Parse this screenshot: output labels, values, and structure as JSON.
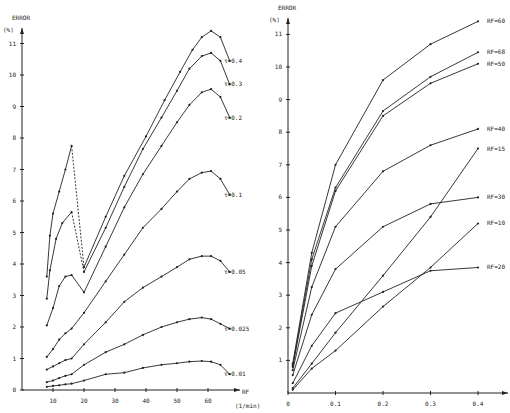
{
  "chart_data": [
    {
      "type": "line",
      "title": "",
      "ylabel": "ERROR",
      "yunit": "(%)",
      "xlabel": "RF",
      "xunit": "(1/min)",
      "xlim": [
        0,
        70
      ],
      "ylim": [
        0,
        11.5
      ],
      "xticks": [
        10,
        20,
        30,
        40,
        50,
        60
      ],
      "yticks": [
        0,
        1,
        2,
        3,
        4,
        5,
        6,
        7,
        8,
        9,
        10,
        11
      ],
      "grid": false,
      "legend_position": "inline-right",
      "note": "Segments between RF=16 and RF=20 for tau=0.4 and tau=0.3 are dashed",
      "series": [
        {
          "name": "τ=0.4",
          "dashed_segment": [
            16,
            20
          ],
          "points": [
            [
              8,
              3.6
            ],
            [
              9,
              4.9
            ],
            [
              10,
              5.6
            ],
            [
              12,
              6.3
            ],
            [
              14,
              7.0
            ],
            [
              16,
              7.75
            ],
            [
              20,
              3.9
            ],
            [
              27,
              5.5
            ],
            [
              33,
              6.8
            ],
            [
              40,
              8.05
            ],
            [
              46,
              9.2
            ],
            [
              51,
              10.1
            ],
            [
              55,
              10.8
            ],
            [
              58,
              11.2
            ],
            [
              61,
              11.4
            ],
            [
              64,
              11.2
            ],
            [
              67,
              10.45
            ]
          ]
        },
        {
          "name": "τ=0.3",
          "dashed_segment": [
            16,
            20
          ],
          "points": [
            [
              8,
              2.9
            ],
            [
              9,
              3.8
            ],
            [
              11,
              4.8
            ],
            [
              13,
              5.3
            ],
            [
              16,
              5.65
            ],
            [
              20,
              3.75
            ],
            [
              27,
              5.15
            ],
            [
              33,
              6.45
            ],
            [
              39,
              7.65
            ],
            [
              45,
              8.65
            ],
            [
              50,
              9.5
            ],
            [
              54,
              10.2
            ],
            [
              58,
              10.6
            ],
            [
              61,
              10.7
            ],
            [
              64,
              10.45
            ],
            [
              67,
              9.7
            ]
          ]
        },
        {
          "name": "τ=0.2",
          "points": [
            [
              8,
              2.05
            ],
            [
              10,
              2.6
            ],
            [
              12,
              3.3
            ],
            [
              14,
              3.6
            ],
            [
              16,
              3.65
            ],
            [
              20,
              3.1
            ],
            [
              27,
              4.55
            ],
            [
              33,
              5.8
            ],
            [
              39,
              6.85
            ],
            [
              45,
              7.75
            ],
            [
              50,
              8.5
            ],
            [
              54,
              9.05
            ],
            [
              58,
              9.45
            ],
            [
              61,
              9.55
            ],
            [
              64,
              9.3
            ],
            [
              67,
              8.65
            ]
          ]
        },
        {
          "name": "τ=0.1",
          "points": [
            [
              8,
              1.05
            ],
            [
              10,
              1.3
            ],
            [
              12,
              1.6
            ],
            [
              14,
              1.8
            ],
            [
              16,
              1.95
            ],
            [
              20,
              2.45
            ],
            [
              27,
              3.45
            ],
            [
              33,
              4.3
            ],
            [
              39,
              5.15
            ],
            [
              45,
              5.75
            ],
            [
              50,
              6.3
            ],
            [
              54,
              6.7
            ],
            [
              58,
              6.9
            ],
            [
              61,
              6.95
            ],
            [
              64,
              6.7
            ],
            [
              67,
              6.2
            ]
          ]
        },
        {
          "name": "τ=0.05",
          "points": [
            [
              8,
              0.65
            ],
            [
              10,
              0.75
            ],
            [
              12,
              0.85
            ],
            [
              14,
              0.95
            ],
            [
              16,
              1.0
            ],
            [
              20,
              1.45
            ],
            [
              27,
              2.15
            ],
            [
              33,
              2.8
            ],
            [
              39,
              3.25
            ],
            [
              45,
              3.6
            ],
            [
              50,
              3.9
            ],
            [
              54,
              4.15
            ],
            [
              58,
              4.25
            ],
            [
              61,
              4.25
            ],
            [
              64,
              4.1
            ],
            [
              67,
              3.75
            ]
          ]
        },
        {
          "name": "τ=0.025",
          "points": [
            [
              8,
              0.25
            ],
            [
              10,
              0.3
            ],
            [
              12,
              0.38
            ],
            [
              14,
              0.45
            ],
            [
              16,
              0.5
            ],
            [
              20,
              0.8
            ],
            [
              27,
              1.2
            ],
            [
              33,
              1.45
            ],
            [
              39,
              1.75
            ],
            [
              45,
              2.0
            ],
            [
              50,
              2.15
            ],
            [
              54,
              2.25
            ],
            [
              58,
              2.3
            ],
            [
              61,
              2.25
            ],
            [
              64,
              2.1
            ],
            [
              67,
              1.95
            ]
          ]
        },
        {
          "name": "τ=0.01",
          "points": [
            [
              8,
              0.1
            ],
            [
              10,
              0.13
            ],
            [
              12,
              0.15
            ],
            [
              14,
              0.18
            ],
            [
              16,
              0.2
            ],
            [
              20,
              0.3
            ],
            [
              27,
              0.5
            ],
            [
              33,
              0.55
            ],
            [
              39,
              0.7
            ],
            [
              45,
              0.8
            ],
            [
              50,
              0.85
            ],
            [
              54,
              0.9
            ],
            [
              58,
              0.92
            ],
            [
              61,
              0.9
            ],
            [
              64,
              0.8
            ],
            [
              67,
              0.5
            ]
          ]
        }
      ]
    },
    {
      "type": "line",
      "title": "",
      "ylabel": "ERROR",
      "yunit": "(%)",
      "xlabel": "",
      "xlim": [
        0,
        0.45
      ],
      "ylim": [
        0,
        11.5
      ],
      "xticks": [
        0,
        0.1,
        0.2,
        0.3,
        0.4
      ],
      "xtick_labels": [
        "0",
        "0.1",
        "0.2",
        "0.3",
        "0.4"
      ],
      "yticks": [
        1,
        2,
        3,
        4,
        5,
        6,
        7,
        8,
        9,
        10,
        11
      ],
      "grid": false,
      "legend_position": "inline-right",
      "series": [
        {
          "name": "RF=60",
          "points": [
            [
              0.01,
              0.9
            ],
            [
              0.05,
              4.3
            ],
            [
              0.1,
              7.0
            ],
            [
              0.2,
              9.6
            ],
            [
              0.3,
              10.7
            ],
            [
              0.4,
              11.4
            ]
          ]
        },
        {
          "name": "RF=68",
          "points": [
            [
              0.01,
              0.85
            ],
            [
              0.05,
              4.1
            ],
            [
              0.1,
              6.3
            ],
            [
              0.2,
              8.65
            ],
            [
              0.3,
              9.7
            ],
            [
              0.4,
              10.45
            ]
          ]
        },
        {
          "name": "RF=50",
          "points": [
            [
              0.01,
              0.8
            ],
            [
              0.05,
              3.9
            ],
            [
              0.1,
              6.2
            ],
            [
              0.2,
              8.5
            ],
            [
              0.3,
              9.5
            ],
            [
              0.4,
              10.1
            ]
          ]
        },
        {
          "name": "RF=40",
          "points": [
            [
              0.01,
              0.7
            ],
            [
              0.05,
              3.25
            ],
            [
              0.1,
              5.1
            ],
            [
              0.2,
              6.8
            ],
            [
              0.3,
              7.6
            ],
            [
              0.4,
              8.1
            ]
          ]
        },
        {
          "name": "RF=15",
          "points": [
            [
              0.01,
              0.15
            ],
            [
              0.05,
              0.9
            ],
            [
              0.1,
              1.85
            ],
            [
              0.2,
              3.6
            ],
            [
              0.3,
              5.4
            ],
            [
              0.4,
              7.5
            ]
          ]
        },
        {
          "name": "RF=30",
          "points": [
            [
              0.01,
              0.55
            ],
            [
              0.05,
              2.4
            ],
            [
              0.1,
              3.8
            ],
            [
              0.2,
              5.1
            ],
            [
              0.3,
              5.8
            ],
            [
              0.4,
              6.0
            ]
          ]
        },
        {
          "name": "RF=10",
          "points": [
            [
              0.01,
              0.1
            ],
            [
              0.05,
              0.75
            ],
            [
              0.1,
              1.3
            ],
            [
              0.2,
              2.65
            ],
            [
              0.3,
              3.85
            ],
            [
              0.4,
              5.2
            ]
          ]
        },
        {
          "name": "RF=20",
          "points": [
            [
              0.01,
              0.3
            ],
            [
              0.05,
              1.45
            ],
            [
              0.1,
              2.45
            ],
            [
              0.2,
              3.1
            ],
            [
              0.3,
              3.75
            ],
            [
              0.4,
              3.85
            ]
          ]
        }
      ]
    }
  ],
  "colors": {
    "ink": "#222222",
    "background": "#ffffff"
  }
}
